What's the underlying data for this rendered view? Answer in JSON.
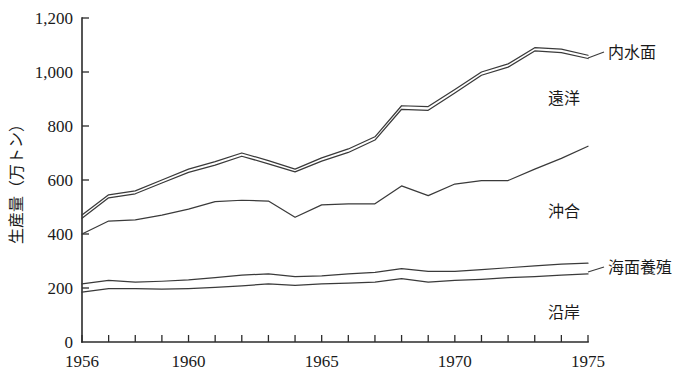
{
  "chart_data": {
    "type": "line",
    "title": "",
    "xlabel": "",
    "ylabel": "生産量（万トン）",
    "xlim": [
      1956,
      1975
    ],
    "ylim": [
      0,
      1200
    ],
    "grid": false,
    "legend_position": "right-inline-labels",
    "x": [
      1956,
      1957,
      1958,
      1959,
      1960,
      1961,
      1962,
      1963,
      1964,
      1965,
      1966,
      1967,
      1968,
      1969,
      1970,
      1971,
      1972,
      1973,
      1974,
      1975
    ],
    "y_ticks": [
      0,
      200,
      400,
      600,
      800,
      1000,
      1200
    ],
    "y_tick_labels": [
      "0",
      "200",
      "400",
      "600",
      "800",
      "1,000",
      "1,200"
    ],
    "x_tick_labels": [
      "1956",
      "1960",
      "1965",
      "1970",
      "1975"
    ],
    "x_tick_values": [
      1956,
      1960,
      1965,
      1970,
      1975
    ],
    "series": [
      {
        "name": "内水面",
        "label": "内水面",
        "description": "cumulative total including inland water (topmost line)",
        "values": [
          470,
          545,
          560,
          600,
          640,
          668,
          700,
          672,
          640,
          682,
          715,
          760,
          875,
          872,
          935,
          1000,
          1030,
          1090,
          1085,
          1062
        ]
      },
      {
        "name": "遠洋",
        "label": "遠洋",
        "description": "cumulative total through distant-water fisheries (second line, just below topmost)",
        "values": [
          458,
          534,
          549,
          589,
          628,
          655,
          688,
          660,
          630,
          670,
          702,
          748,
          862,
          858,
          922,
          988,
          1018,
          1078,
          1072,
          1050
        ]
      },
      {
        "name": "沖合",
        "label": "沖合",
        "description": "cumulative total through offshore fisheries (middle line)",
        "values": [
          400,
          448,
          452,
          470,
          492,
          520,
          525,
          522,
          462,
          508,
          512,
          512,
          578,
          542,
          585,
          598,
          598,
          640,
          680,
          725
        ]
      },
      {
        "name": "海面養殖",
        "label": "海面養殖",
        "description": "cumulative total through marine aquaculture (upper of the two low lines)",
        "values": [
          215,
          228,
          222,
          225,
          230,
          238,
          248,
          252,
          242,
          245,
          252,
          258,
          272,
          262,
          262,
          268,
          275,
          282,
          288,
          292
        ]
      },
      {
        "name": "沿岸",
        "label": "沿岸",
        "description": "coastal fisheries (lowest line)",
        "values": [
          185,
          198,
          198,
          196,
          198,
          202,
          208,
          215,
          210,
          215,
          218,
          222,
          235,
          222,
          228,
          232,
          238,
          242,
          248,
          252
        ]
      }
    ]
  },
  "axis": {
    "y_title": "生産量（万トン）"
  },
  "labels": {
    "inland": "内水面",
    "distant": "遠洋",
    "offshore": "沖合",
    "aquaculture": "海面養殖",
    "coastal": "沿岸"
  }
}
